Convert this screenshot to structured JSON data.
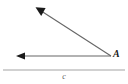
{
  "figure": {
    "type": "geometry-angle-diagram",
    "background_color": "#ffffff",
    "width": 128,
    "height": 84,
    "vertex_label": "A",
    "caption_label": "c",
    "stroke_color": "#555555",
    "arrowhead_color": "#1a1a1a",
    "divider_color": "#bfbfbf",
    "rays": [
      {
        "name": "horizontal-ray",
        "from": [
          111,
          56
        ],
        "to": [
          17,
          56
        ],
        "arrow_at": "to",
        "direction": "left"
      },
      {
        "name": "diagonal-ray",
        "from": [
          111,
          56
        ],
        "to": [
          36,
          8
        ],
        "arrow_at": "to",
        "direction": "up-left"
      }
    ],
    "divider": {
      "name": "bottom-divider",
      "from": [
        3,
        70
      ],
      "to": [
        125,
        70
      ]
    }
  }
}
